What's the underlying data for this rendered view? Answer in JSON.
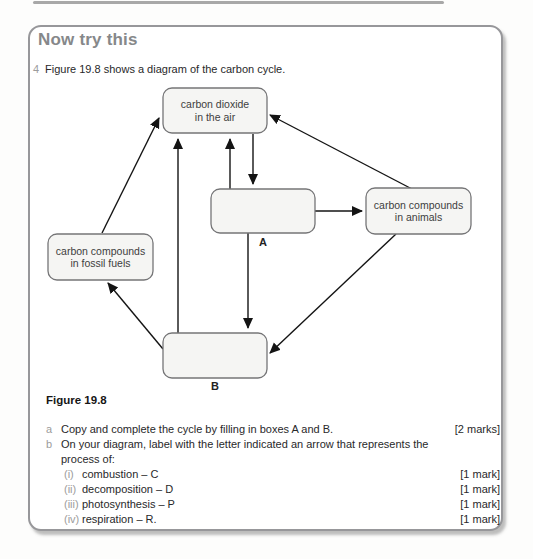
{
  "colors": {
    "panel_border": "#97979a",
    "title_gray": "#86888a",
    "muted_gray": "#9c9c9c",
    "text_dark": "#28282a",
    "box_fill": "#f5f5f3",
    "box_stroke": "#757577",
    "arrow": "#141414"
  },
  "header": {
    "title": "Now try this"
  },
  "question": {
    "number": "4",
    "text": "Figure 19.8 shows a diagram of the carbon cycle."
  },
  "figure": {
    "caption": "Figure 19.8"
  },
  "diagram": {
    "nodes": {
      "co2": {
        "line1": "carbon dioxide",
        "line2": "in the air"
      },
      "animals": {
        "line1": "carbon compounds",
        "line2": "in animals"
      },
      "fossil_fuels": {
        "line1": "carbon compounds",
        "line2": "in fossil fuels"
      },
      "box_a": {
        "label": "A"
      },
      "box_b": {
        "label": "B"
      }
    }
  },
  "tasks": {
    "a": {
      "letter": "a",
      "text": "Copy and complete the cycle by filling in boxes A and B.",
      "marks": "[2 marks]"
    },
    "b": {
      "letter": "b",
      "text_line1": "On your diagram, label with the letter indicated an arrow that represents the",
      "text_line2": "process of:"
    },
    "subitems": [
      {
        "numeral": "(i)",
        "text": "combustion – C",
        "marks": "[1 mark]"
      },
      {
        "numeral": "(ii)",
        "text": "decomposition – D",
        "marks": "[1 mark]"
      },
      {
        "numeral": "(iii)",
        "text": "photosynthesis – P",
        "marks": "[1 mark]"
      },
      {
        "numeral": "(iv)",
        "text": "respiration – R.",
        "marks": "[1 mark]"
      }
    ]
  }
}
